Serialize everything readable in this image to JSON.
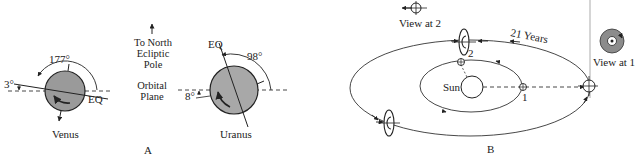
{
  "panel_a": {
    "label": "A",
    "center_text": {
      "pole_line1": "To North",
      "pole_line2": "Ecliptic",
      "pole_line3": "Pole",
      "plane_line1": "Orbital",
      "plane_line2": "Plane"
    },
    "venus": {
      "name": "Venus",
      "obliquity_label": "177°",
      "tilt_label": "3°",
      "equator_label": "EQ",
      "fill_color": "#9a9a9a"
    },
    "uranus": {
      "name": "Uranus",
      "obliquity_label": "98°",
      "tilt_label": "8°",
      "equator_label": "EQ",
      "fill_color": "#a8a8a8"
    }
  },
  "panel_b": {
    "label": "B",
    "sun_label": "Sun",
    "period_label": "21 Years",
    "position_1_label": "1",
    "position_2_label": "2",
    "view_at_1_label": "View at 1",
    "view_at_2_label": "View at 2",
    "view_1_fill": "#8c8c8c"
  }
}
